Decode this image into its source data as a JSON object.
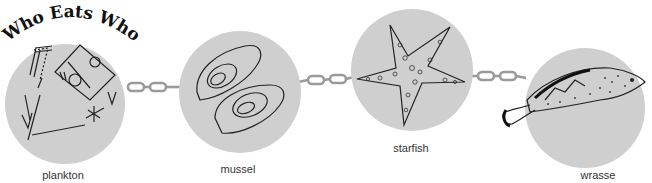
{
  "title": "Who Eats Who?",
  "colors": {
    "circle_fill": "#cfcfcf",
    "chain": "#9a9a9a",
    "ink": "#222222"
  },
  "organisms": [
    {
      "label": "plankton",
      "icon": "plankton-icon"
    },
    {
      "label": "mussel",
      "icon": "mussel-icon"
    },
    {
      "label": "starfish",
      "icon": "starfish-icon"
    },
    {
      "label": "wrasse",
      "icon": "wrasse-icon"
    }
  ],
  "links": [
    {
      "from": "plankton",
      "to": "mussel",
      "icon": "chain-icon"
    },
    {
      "from": "mussel",
      "to": "starfish",
      "icon": "chain-icon"
    },
    {
      "from": "starfish",
      "to": "wrasse",
      "icon": "chain-icon"
    }
  ]
}
